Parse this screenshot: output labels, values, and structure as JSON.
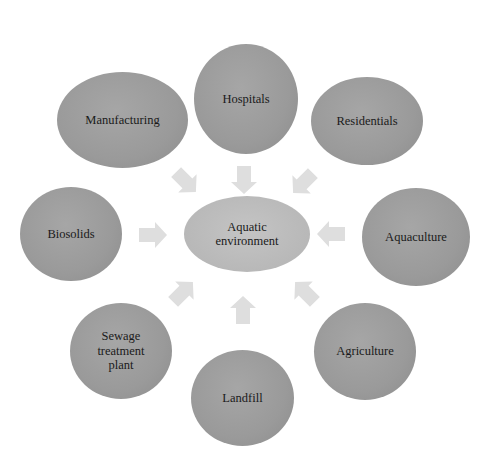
{
  "diagram": {
    "center": {
      "label_line1": "Aquatic",
      "label_line2": "environment"
    },
    "sources": [
      {
        "label": "Hospitals"
      },
      {
        "label": "Residentials"
      },
      {
        "label": "Aquaculture"
      },
      {
        "label": "Agriculture"
      },
      {
        "label": "Landfill"
      },
      {
        "label_line1": "Sewage",
        "label_line2": "treatment",
        "label_line3": "plant"
      },
      {
        "label": "Biosolids"
      },
      {
        "label": "Manufacturing"
      }
    ],
    "colors": {
      "source_fill": "#9a9a9a",
      "center_fill": "#b8b8b8",
      "arrow_fill": "#dedede",
      "text": "#1a1a1a"
    }
  }
}
